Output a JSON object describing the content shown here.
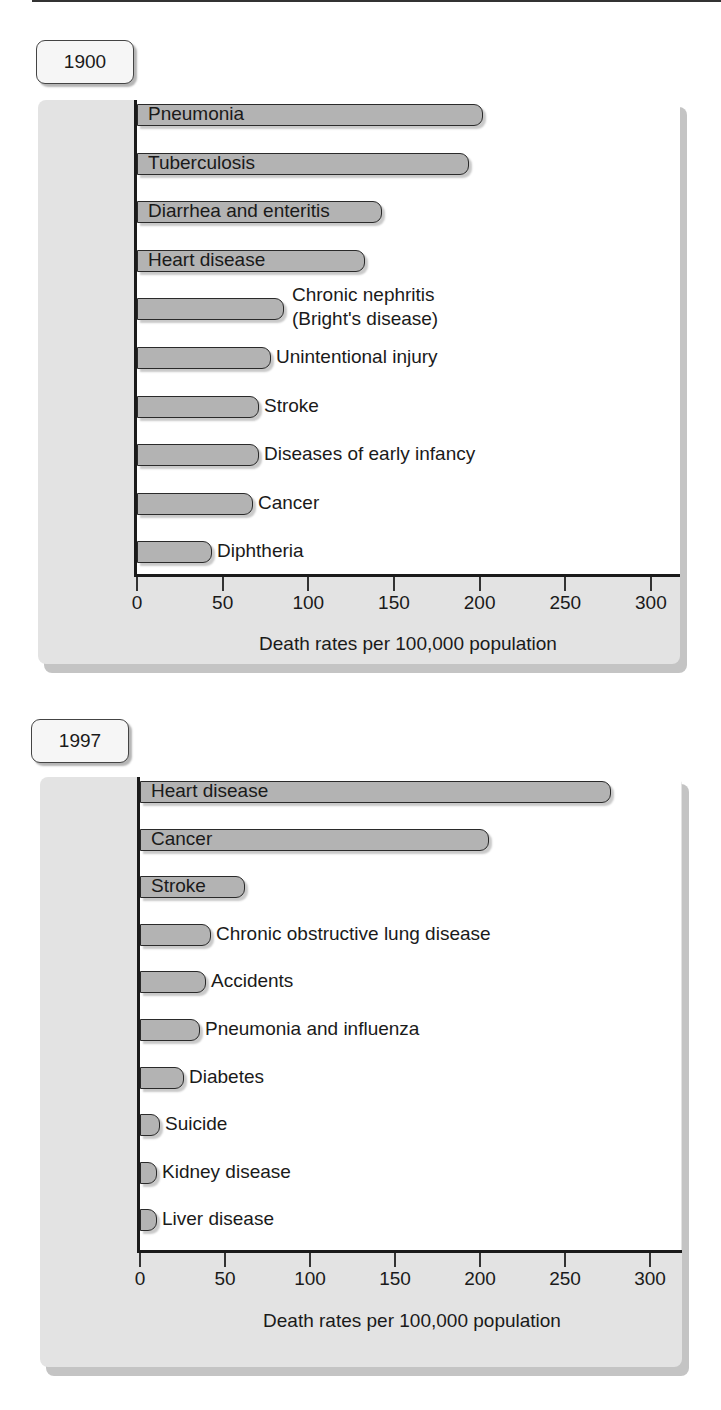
{
  "chart_data": [
    {
      "type": "bar",
      "orientation": "horizontal",
      "title": "1900",
      "xlabel": "Death rates per 100,000 population",
      "ylabel": "",
      "xlim": [
        0,
        300
      ],
      "xticks": [
        "0",
        "50",
        "100",
        "150",
        "200",
        "250",
        "300"
      ],
      "grid": false,
      "legend": null,
      "categories": [
        "Pneumonia",
        "Tuberculosis",
        "Diarrhea and enteritis",
        "Heart disease",
        "Chronic nephritis (Bright's disease)",
        "Unintentional injury",
        "Stroke",
        "Diseases of early infancy",
        "Cancer",
        "Diphtheria"
      ],
      "values": [
        202,
        194,
        143,
        133,
        86,
        78,
        71,
        71,
        68,
        44
      ]
    },
    {
      "type": "bar",
      "orientation": "horizontal",
      "title": "1997",
      "xlabel": "Death rates per 100,000 population",
      "ylabel": "",
      "xlim": [
        0,
        300
      ],
      "xticks": [
        "0",
        "50",
        "100",
        "150",
        "200",
        "250",
        "300"
      ],
      "grid": false,
      "legend": null,
      "categories": [
        "Heart disease",
        "Cancer",
        "Stroke",
        "Chronic obstructive lung disease",
        "Accidents",
        "Pneumonia and influenza",
        "Diabetes",
        "Suicide",
        "Kidney disease",
        "Liver disease"
      ],
      "values": [
        277,
        205,
        62,
        42,
        39,
        35,
        26,
        12,
        10,
        10
      ]
    }
  ],
  "charts": [
    {
      "year": "1900",
      "xlabel": "Death rates per 100,000 population",
      "ticks": [
        "0",
        "50",
        "100",
        "150",
        "200",
        "250",
        "300"
      ],
      "bars": [
        {
          "label": "Pneumonia",
          "value": 202,
          "inside": true
        },
        {
          "label": "Tuberculosis",
          "value": 194,
          "inside": true
        },
        {
          "label": "Diarrhea and enteritis",
          "value": 143,
          "inside": true
        },
        {
          "label": "Heart disease",
          "value": 133,
          "inside": true
        },
        {
          "label": "Chronic nephritis",
          "label2": "(Bright's disease)",
          "value": 86,
          "inside": false
        },
        {
          "label": "Unintentional injury",
          "value": 78,
          "inside": false
        },
        {
          "label": "Stroke",
          "value": 71,
          "inside": false
        },
        {
          "label": "Diseases of early infancy",
          "value": 71,
          "inside": false
        },
        {
          "label": "Cancer",
          "value": 68,
          "inside": false
        },
        {
          "label": "Diphtheria",
          "value": 44,
          "inside": false
        }
      ]
    },
    {
      "year": "1997",
      "xlabel": "Death rates per 100,000 population",
      "ticks": [
        "0",
        "50",
        "100",
        "150",
        "200",
        "250",
        "300"
      ],
      "bars": [
        {
          "label": "Heart disease",
          "value": 277,
          "inside": true
        },
        {
          "label": "Cancer",
          "value": 205,
          "inside": true
        },
        {
          "label": "Stroke",
          "value": 62,
          "inside": true
        },
        {
          "label": "Chronic obstructive lung disease",
          "value": 42,
          "inside": false
        },
        {
          "label": "Accidents",
          "value": 39,
          "inside": false
        },
        {
          "label": "Pneumonia and influenza",
          "value": 35,
          "inside": false
        },
        {
          "label": "Diabetes",
          "value": 26,
          "inside": false
        },
        {
          "label": "Suicide",
          "value": 12,
          "inside": false
        },
        {
          "label": "Kidney disease",
          "value": 10,
          "inside": false
        },
        {
          "label": "Liver disease",
          "value": 10,
          "inside": false
        }
      ]
    }
  ],
  "colors": {
    "bar_fill": "#b3b3b3",
    "bar_border": "#2a2a2a",
    "panel_bg": "#e3e3e3",
    "panel_shadow": "#c4c4c4",
    "axis": "#1a1a1a"
  }
}
